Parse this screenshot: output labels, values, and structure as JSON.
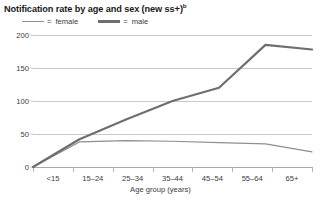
{
  "chart_data": {
    "type": "line",
    "title": "Notification rate by age and sex (new ss+)",
    "title_superscript": "b",
    "xlabel": "Age group (years)",
    "ylabel": "",
    "categories": [
      "<15",
      "15–24",
      "25–34",
      "35–44",
      "45–54",
      "55–64",
      "65+"
    ],
    "ytick_labels": [
      "0",
      "50",
      "100",
      "150",
      "200"
    ],
    "ytick_values": [
      0,
      50,
      100,
      150,
      200
    ],
    "ylim": [
      0,
      200
    ],
    "grid": true,
    "legend_position": "top-left",
    "series": [
      {
        "name": "female",
        "label": "= female",
        "color": "#8e8e8e",
        "width": 1.2,
        "values": [
          0,
          38,
          40,
          39,
          37,
          35,
          23
        ]
      },
      {
        "name": "male",
        "label": "= male",
        "color": "#6e6e6e",
        "width": 2.2,
        "values": [
          0,
          42,
          72,
          100,
          120,
          185,
          178
        ]
      }
    ]
  },
  "legend": {
    "female": {
      "equals": "=",
      "label": "female"
    },
    "male": {
      "equals": "=",
      "label": "male"
    }
  },
  "colors": {
    "gridline": "#c9c9c9",
    "axis": "#a8a8a8",
    "text": "#3b3b3b",
    "title": "#1a1a1a",
    "female_line": "#8e8e8e",
    "male_line": "#6e6e6e"
  }
}
